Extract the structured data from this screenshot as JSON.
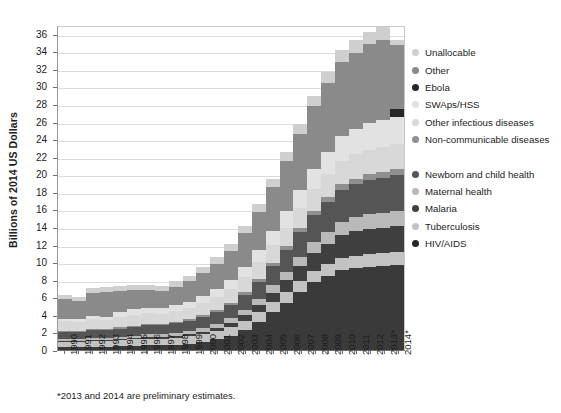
{
  "chart_data": {
    "type": "bar",
    "stacked": true,
    "title": "",
    "xlabel": "",
    "ylabel": "Billions of 2014 US Dollars",
    "ylim": [
      0,
      37
    ],
    "ytick_step": 2,
    "yticks": [
      0,
      2,
      4,
      6,
      8,
      10,
      12,
      14,
      16,
      18,
      20,
      22,
      24,
      26,
      28,
      30,
      32,
      34,
      36
    ],
    "grid": true,
    "legend_position": "right",
    "footnote": "*2013 and 2014 are preliminary estimates.",
    "categories": [
      "1990",
      "1991",
      "1992",
      "1993",
      "1994",
      "1995",
      "1996",
      "1997",
      "1998",
      "1999",
      "2000",
      "2001",
      "2002",
      "2003",
      "2004",
      "2005",
      "2006",
      "2007",
      "2008",
      "2009",
      "2010",
      "2011",
      "2012",
      "2013*",
      "2014*"
    ],
    "series": [
      {
        "name": "HIV/AIDS",
        "color": "#3a3a3a",
        "values": [
          0.35,
          0.35,
          0.4,
          0.4,
          0.45,
          0.5,
          0.55,
          0.55,
          0.6,
          0.7,
          0.9,
          1.2,
          1.6,
          2.3,
          3.2,
          4.3,
          5.4,
          6.6,
          7.7,
          8.4,
          9.1,
          9.3,
          9.5,
          9.6,
          9.7
        ]
      },
      {
        "name": "Tuberculosis",
        "color": "#c3c3c3",
        "values": [
          0.55,
          0.55,
          0.6,
          0.6,
          0.65,
          0.7,
          0.75,
          0.75,
          0.8,
          0.85,
          0.9,
          0.95,
          1.0,
          1.05,
          1.1,
          1.15,
          1.2,
          1.25,
          1.3,
          1.35,
          1.4,
          1.45,
          1.45,
          1.5,
          1.5
        ]
      },
      {
        "name": "Malaria",
        "color": "#3f3f3f",
        "values": [
          0.1,
          0.1,
          0.1,
          0.1,
          0.1,
          0.12,
          0.14,
          0.15,
          0.18,
          0.22,
          0.28,
          0.35,
          0.45,
          0.6,
          0.8,
          1.05,
          1.35,
          1.7,
          2.05,
          2.35,
          2.6,
          2.75,
          2.85,
          2.9,
          2.95
        ]
      },
      {
        "name": "Maternal health",
        "color": "#b9b9b9",
        "values": [
          0.25,
          0.25,
          0.28,
          0.28,
          0.3,
          0.32,
          0.34,
          0.36,
          0.38,
          0.42,
          0.46,
          0.52,
          0.58,
          0.66,
          0.75,
          0.85,
          0.95,
          1.05,
          1.2,
          1.35,
          1.5,
          1.6,
          1.65,
          1.7,
          1.72
        ]
      },
      {
        "name": "Newborn and child health",
        "color": "#555555",
        "values": [
          0.85,
          0.85,
          0.9,
          0.9,
          0.95,
          1.0,
          1.05,
          1.05,
          1.1,
          1.15,
          1.25,
          1.35,
          1.5,
          1.7,
          1.95,
          2.2,
          2.5,
          2.8,
          3.1,
          3.4,
          3.65,
          3.8,
          3.9,
          4.0,
          4.05
        ]
      },
      {
        "name": "Non-communicable diseases",
        "color": "#8f8f8f",
        "values": [
          0.1,
          0.1,
          0.1,
          0.12,
          0.12,
          0.14,
          0.14,
          0.15,
          0.16,
          0.18,
          0.2,
          0.22,
          0.25,
          0.28,
          0.32,
          0.36,
          0.4,
          0.45,
          0.5,
          0.55,
          0.6,
          0.62,
          0.65,
          0.67,
          0.68
        ]
      },
      {
        "name": "Other infectious diseases",
        "color": "#d8d8d8",
        "values": [
          1.05,
          1.0,
          1.1,
          1.05,
          1.2,
          1.25,
          1.2,
          1.15,
          1.25,
          1.3,
          1.4,
          1.45,
          1.55,
          1.7,
          1.85,
          2.0,
          2.15,
          2.3,
          2.45,
          2.6,
          2.7,
          2.75,
          2.8,
          2.85,
          2.85
        ]
      },
      {
        "name": "SWAps/HSS",
        "color": "#e2e2e2",
        "values": [
          0.3,
          0.3,
          0.35,
          0.35,
          0.6,
          0.65,
          0.65,
          0.6,
          0.65,
          0.7,
          0.8,
          0.9,
          1.05,
          1.2,
          1.4,
          1.6,
          1.85,
          2.1,
          2.35,
          2.6,
          2.8,
          2.9,
          3.0,
          3.05,
          3.05
        ]
      },
      {
        "name": "Ebola",
        "color": "#272727",
        "values": [
          0,
          0,
          0,
          0,
          0,
          0,
          0,
          0,
          0,
          0,
          0,
          0,
          0,
          0,
          0,
          0,
          0,
          0,
          0,
          0,
          0,
          0,
          0,
          0,
          0.9
        ]
      },
      {
        "name": "Other",
        "color": "#8a8a8a",
        "values": [
          2.25,
          2.1,
          2.7,
          2.85,
          2.4,
          2.2,
          2.05,
          1.95,
          2.1,
          2.3,
          2.6,
          2.9,
          3.3,
          3.8,
          4.4,
          5.0,
          5.7,
          6.4,
          7.1,
          7.8,
          8.4,
          8.7,
          9.0,
          9.2,
          7.3
        ]
      },
      {
        "name": "Unallocable",
        "color": "#cfcfcf",
        "values": [
          0.45,
          0.45,
          0.5,
          0.5,
          0.55,
          0.55,
          0.55,
          0.55,
          0.6,
          0.62,
          0.66,
          0.7,
          0.76,
          0.82,
          0.9,
          0.98,
          1.06,
          1.14,
          1.22,
          1.3,
          1.36,
          1.4,
          1.42,
          1.46,
          0.6
        ]
      }
    ],
    "totals": [
      6.3,
      6.05,
      7.03,
      7.15,
      7.32,
      7.43,
      7.42,
      7.26,
      7.82,
      8.44,
      9.45,
      10.54,
      12.04,
      14.11,
      16.67,
      19.49,
      22.56,
      25.79,
      28.97,
      31.7,
      34.11,
      35.27,
      36.12,
      36.33,
      35.3
    ]
  },
  "legend": {
    "items": [
      {
        "label": "Unallocable",
        "color": "#cfcfcf",
        "gap": false
      },
      {
        "label": "Other",
        "color": "#8a8a8a",
        "gap": false
      },
      {
        "label": "Ebola",
        "color": "#272727",
        "gap": false
      },
      {
        "label": "SWAps/HSS",
        "color": "#e2e2e2",
        "gap": false
      },
      {
        "label": "Other infectious diseases",
        "color": "#d8d8d8",
        "gap": false
      },
      {
        "label": "Non-communicable diseases",
        "color": "#8f8f8f",
        "gap": false
      },
      {
        "label": "Newborn and child health",
        "color": "#555555",
        "gap": true
      },
      {
        "label": "Maternal health",
        "color": "#b9b9b9",
        "gap": false
      },
      {
        "label": "Malaria",
        "color": "#3f3f3f",
        "gap": false
      },
      {
        "label": "Tuberculosis",
        "color": "#c3c3c3",
        "gap": false
      },
      {
        "label": "HIV/AIDS",
        "color": "#272727",
        "gap": false
      }
    ]
  }
}
